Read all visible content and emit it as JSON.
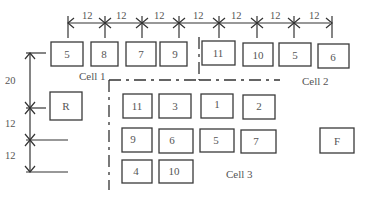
{
  "diagram": {
    "cells": [
      {
        "label": "Cell 1"
      },
      {
        "label": "Cell 2"
      },
      {
        "label": "Cell 3"
      }
    ],
    "row1_machines": [
      "5",
      "8",
      "7",
      "9",
      "11",
      "10",
      "5",
      "6"
    ],
    "cell3_machines": {
      "row1": [
        "11",
        "3",
        "1",
        "2"
      ],
      "row2": [
        "9",
        "6",
        "5",
        "7"
      ],
      "row3": [
        "4",
        "10"
      ]
    },
    "receiving": "R",
    "finishing": "F",
    "horizontal_spacing": [
      "12",
      "12",
      "12",
      "12",
      "12",
      "12",
      "12"
    ],
    "vertical_spacing": [
      "20",
      "12",
      "12"
    ]
  }
}
